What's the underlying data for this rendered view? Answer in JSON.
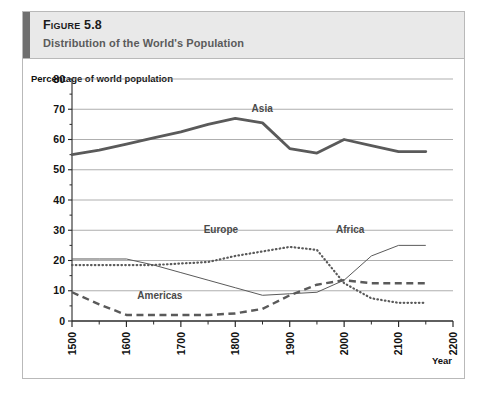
{
  "figure": {
    "label": "Figure 5.8",
    "subtitle": "Distribution of the World's Population",
    "accent_color": "#6f6f6f",
    "header_bg": "#e9e9e9"
  },
  "axis": {
    "ylabel": "Percentage of world population",
    "xlabel": "Year",
    "yticks": [
      "0",
      "10",
      "20",
      "30",
      "40",
      "50",
      "60",
      "70",
      "80"
    ],
    "xticks": [
      "1500",
      "1600",
      "1700",
      "1800",
      "1900",
      "2000",
      "2100",
      "2200"
    ]
  },
  "series_labels": {
    "asia": "Asia",
    "europe": "Europe",
    "africa": "Africa",
    "americas": "Americas"
  },
  "chart_data": {
    "type": "line",
    "title": "Distribution of the World's Population",
    "xlabel": "Year",
    "ylabel": "Percentage of world population",
    "xlim": [
      1500,
      2200
    ],
    "ylim": [
      0,
      80
    ],
    "grid": true,
    "legend": "inline-annotations",
    "x": [
      1500,
      1550,
      1600,
      1650,
      1700,
      1750,
      1800,
      1850,
      1900,
      1950,
      2000,
      2050,
      2100,
      2150
    ],
    "series": [
      {
        "name": "Asia",
        "style": "thick-solid",
        "color": "#5a5a5a",
        "values": [
          55.0,
          56.5,
          58.5,
          60.5,
          62.5,
          65.0,
          67.0,
          65.5,
          57.0,
          55.5,
          60.0,
          58.0,
          56.0,
          56.0
        ]
      },
      {
        "name": "Europe",
        "style": "dotted",
        "color": "#5a5a5a",
        "values": [
          18.5,
          18.5,
          18.5,
          18.5,
          19.0,
          19.5,
          21.5,
          23.0,
          24.5,
          23.5,
          12.5,
          7.5,
          6.0,
          6.0
        ]
      },
      {
        "name": "Africa",
        "style": "thin-solid",
        "color": "#5a5a5a",
        "values": [
          20.5,
          20.5,
          20.5,
          18.5,
          16.0,
          13.5,
          11.0,
          8.5,
          9.0,
          9.5,
          13.5,
          21.5,
          25.0,
          25.0
        ]
      },
      {
        "name": "Americas",
        "style": "dashed",
        "color": "#5a5a5a",
        "values": [
          9.5,
          5.5,
          2.0,
          2.0,
          2.0,
          2.0,
          2.5,
          4.0,
          8.5,
          12.0,
          13.5,
          12.5,
          12.5,
          12.5
        ]
      }
    ]
  }
}
